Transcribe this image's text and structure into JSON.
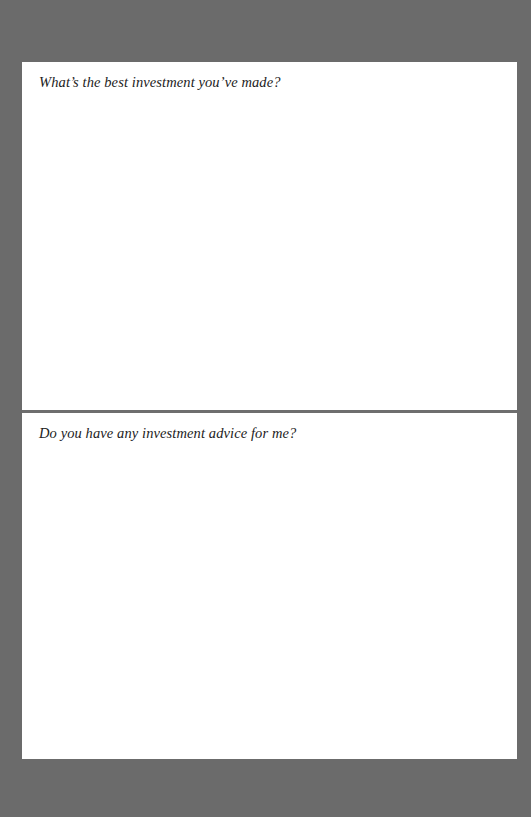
{
  "document": {
    "sections": [
      {
        "prompt": "What’s the best investment you’ve made?",
        "answer": ""
      },
      {
        "prompt": "Do you have any investment advice for me?",
        "answer": ""
      }
    ]
  },
  "colors": {
    "background": "#6b6b6b",
    "page": "#ffffff",
    "divider": "#6e6e6e",
    "text": "#222222"
  }
}
